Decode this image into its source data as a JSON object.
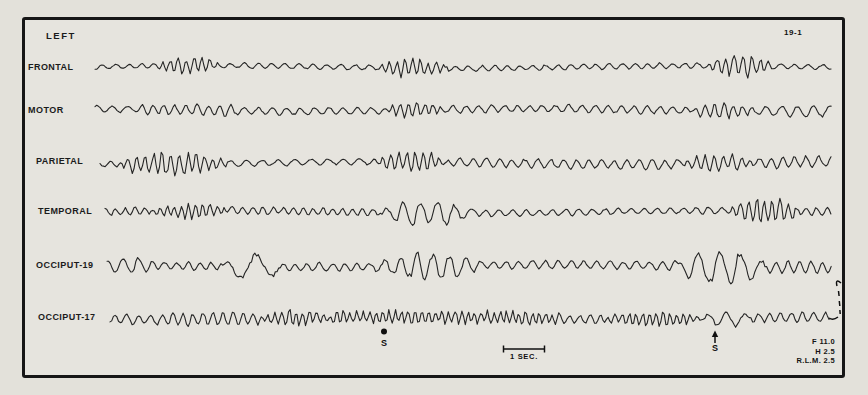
{
  "figure": {
    "side_label": "LEFT",
    "figure_number": "19-1",
    "scale_bar_label": "1 SEC.",
    "settings_lines": [
      "F 11.0",
      "H 2.5",
      "R.L.M. 2.5"
    ]
  },
  "chart_data": {
    "type": "line",
    "time_scale": {
      "label": "1 SEC.",
      "x0": 503,
      "x1": 545
    },
    "events": [
      {
        "label": "S",
        "marker": "dot",
        "x": 384
      },
      {
        "label": "S",
        "marker": "arrow",
        "x": 715
      }
    ],
    "channels": [
      {
        "label": "FRONTAL",
        "segments": [
          {
            "x0": 0,
            "x1": 62,
            "amp": 2.5,
            "wl": 13
          },
          {
            "x0": 62,
            "x1": 125,
            "amp": 9.5,
            "wl": 8,
            "burst": true
          },
          {
            "x0": 125,
            "x1": 285,
            "amp": 2.6,
            "wl": 14
          },
          {
            "x0": 285,
            "x1": 352,
            "amp": 10,
            "wl": 8,
            "burst": true
          },
          {
            "x0": 352,
            "x1": 612,
            "amp": 2.8,
            "wl": 13
          },
          {
            "x0": 612,
            "x1": 678,
            "amp": 12,
            "wl": 8.5,
            "burst": true
          },
          {
            "x0": 678,
            "x1": 737,
            "amp": 2.5,
            "wl": 14
          }
        ]
      },
      {
        "label": "MOTOR",
        "segments": [
          {
            "x0": 0,
            "x1": 45,
            "amp": 3,
            "wl": 15
          },
          {
            "x0": 45,
            "x1": 140,
            "amp": 5.5,
            "wl": 11
          },
          {
            "x0": 140,
            "x1": 290,
            "amp": 3.5,
            "wl": 14
          },
          {
            "x0": 290,
            "x1": 348,
            "amp": 8,
            "wl": 8,
            "burst": true
          },
          {
            "x0": 348,
            "x1": 595,
            "amp": 3.6,
            "wl": 13
          },
          {
            "x0": 595,
            "x1": 662,
            "amp": 8.5,
            "wl": 9,
            "burst": true
          },
          {
            "x0": 662,
            "x1": 737,
            "amp": 5,
            "wl": 16
          }
        ]
      },
      {
        "label": "PARIETAL",
        "segments": [
          {
            "x0": 0,
            "x1": 15,
            "amp": 3,
            "wl": 12
          },
          {
            "x0": 15,
            "x1": 128,
            "amp": 13,
            "wl": 8.5,
            "burst": true
          },
          {
            "x0": 128,
            "x1": 275,
            "amp": 3,
            "wl": 16
          },
          {
            "x0": 275,
            "x1": 348,
            "amp": 11,
            "wl": 8,
            "burst": true
          },
          {
            "x0": 348,
            "x1": 580,
            "amp": 4.5,
            "wl": 13
          },
          {
            "x0": 580,
            "x1": 655,
            "amp": 9,
            "wl": 9,
            "burst": true
          },
          {
            "x0": 655,
            "x1": 732,
            "amp": 5.5,
            "wl": 12
          }
        ]
      },
      {
        "label": "TEMPORAL",
        "segments": [
          {
            "x0": 0,
            "x1": 45,
            "amp": 4,
            "wl": 10
          },
          {
            "x0": 45,
            "x1": 125,
            "amp": 8,
            "wl": 7,
            "burst": true
          },
          {
            "x0": 125,
            "x1": 275,
            "amp": 4,
            "wl": 10
          },
          {
            "x0": 275,
            "x1": 375,
            "amp": 12,
            "wl": 17,
            "burst": true
          },
          {
            "x0": 375,
            "x1": 625,
            "amp": 3.2,
            "wl": 13
          },
          {
            "x0": 625,
            "x1": 695,
            "amp": 14,
            "wl": 8,
            "burst": true
          },
          {
            "x0": 695,
            "x1": 727,
            "amp": 4,
            "wl": 11
          }
        ]
      },
      {
        "label": "OCCIPUT-19",
        "segments": [
          {
            "x0": 0,
            "x1": 45,
            "amp": 7.5,
            "wl": 15
          },
          {
            "x0": 45,
            "x1": 115,
            "amp": 4,
            "wl": 12
          },
          {
            "x0": 115,
            "x1": 175,
            "amp": 11,
            "wl": 33,
            "burst": true
          },
          {
            "x0": 175,
            "x1": 265,
            "amp": 4.2,
            "wl": 12
          },
          {
            "x0": 265,
            "x1": 375,
            "amp": 13,
            "wl": 16,
            "burst": true
          },
          {
            "x0": 375,
            "x1": 565,
            "amp": 4,
            "wl": 13
          },
          {
            "x0": 565,
            "x1": 660,
            "amp": 16,
            "wl": 21,
            "burst": true
          },
          {
            "x0": 660,
            "x1": 725,
            "amp": 6,
            "wl": 12
          }
        ]
      },
      {
        "label": "OCCIPUT-17",
        "segments": [
          {
            "x0": 0,
            "x1": 55,
            "amp": 5,
            "wl": 12
          },
          {
            "x0": 55,
            "x1": 150,
            "amp": 6.5,
            "wl": 10
          },
          {
            "x0": 150,
            "x1": 222,
            "amp": 9,
            "wl": 7,
            "burst": true
          },
          {
            "x0": 222,
            "x1": 450,
            "amp": 7.5,
            "wl": 6.5
          },
          {
            "x0": 450,
            "x1": 492,
            "amp": 5,
            "wl": 11
          },
          {
            "x0": 492,
            "x1": 592,
            "amp": 8,
            "wl": 7,
            "burst": true
          },
          {
            "x0": 592,
            "x1": 642,
            "amp": 8,
            "wl": 19,
            "burst": true
          },
          {
            "x0": 642,
            "x1": 722,
            "amp": 5,
            "wl": 11
          }
        ]
      }
    ]
  }
}
